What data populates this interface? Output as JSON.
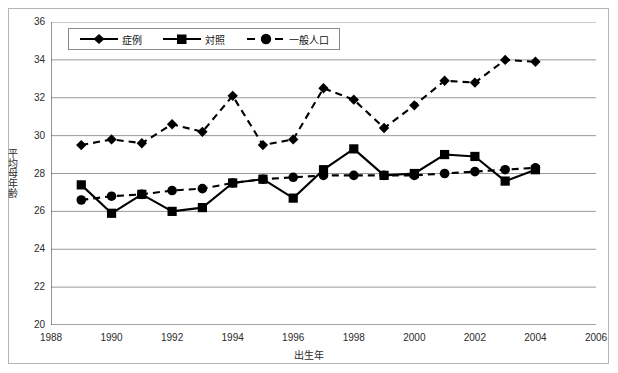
{
  "chart_data": {
    "type": "line",
    "title": "",
    "xlabel": "出生年",
    "ylabel": "平均母年齢",
    "xlim": [
      1988,
      2006
    ],
    "ylim": [
      20,
      36
    ],
    "xticks": [
      1988,
      1990,
      1992,
      1994,
      1996,
      1998,
      2000,
      2002,
      2004,
      2006
    ],
    "yticks": [
      20,
      22,
      24,
      26,
      28,
      30,
      32,
      34,
      36
    ],
    "grid": "horizontal",
    "legend_position": "top-left-inside",
    "x": [
      1989,
      1990,
      1991,
      1992,
      1993,
      1994,
      1995,
      1996,
      1997,
      1998,
      1999,
      2000,
      2001,
      2002,
      2003,
      2004
    ],
    "series": [
      {
        "name": "症例",
        "marker": "diamond",
        "linestyle": "dashed",
        "color": "#000000",
        "values": [
          29.5,
          29.8,
          29.6,
          30.6,
          30.2,
          32.1,
          29.5,
          29.8,
          32.5,
          31.9,
          30.4,
          31.6,
          32.9,
          32.8,
          34.0,
          33.9
        ]
      },
      {
        "name": "対照",
        "marker": "square",
        "linestyle": "solid",
        "color": "#000000",
        "values": [
          27.4,
          25.9,
          26.9,
          26.0,
          26.2,
          27.5,
          27.7,
          26.7,
          28.2,
          29.3,
          27.9,
          28.0,
          29.0,
          28.9,
          27.6,
          28.2
        ]
      },
      {
        "name": "一般人口",
        "marker": "circle",
        "linestyle": "dashed",
        "color": "#000000",
        "values": [
          26.6,
          26.8,
          26.9,
          27.1,
          27.2,
          27.5,
          27.7,
          27.8,
          27.9,
          27.9,
          27.9,
          27.9,
          28.0,
          28.1,
          28.2,
          28.3
        ]
      }
    ]
  },
  "legend": {
    "items": [
      {
        "label": "症例",
        "key": "diamond-solid-line"
      },
      {
        "label": "対照",
        "key": "square-solid-line"
      },
      {
        "label": "一般人口",
        "key": "circle-dashed-line"
      }
    ]
  },
  "axes": {
    "x_title": "出生年",
    "y_title": "平均母年齢"
  }
}
